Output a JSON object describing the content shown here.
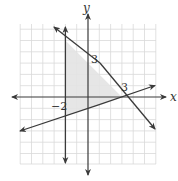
{
  "figure": {
    "type": "linear-inequality-graph",
    "axes": {
      "x_label": "x",
      "y_label": "y"
    },
    "labels": {
      "y_intercept": "3",
      "x_intercept": "3",
      "vertical_line": "−2"
    },
    "grid": {
      "xmin": -6,
      "xmax": 6,
      "ymin": -6,
      "ymax": 6
    },
    "lines": [
      {
        "name": "vertical",
        "equation": "x = -2"
      },
      {
        "name": "decreasing",
        "equation": "y = 3 - x"
      },
      {
        "name": "increasing",
        "equation": "y = (x - 3)/3"
      }
    ],
    "shaded_region": {
      "vertices": [
        [
          -2,
          5
        ],
        [
          3,
          0
        ],
        [
          -2,
          -1.667
        ]
      ],
      "color": "#e3e3e3"
    },
    "colors": {
      "lines": "#3a3a3a",
      "grid": "#d6d6d6",
      "shade": "#e3e3e3"
    }
  }
}
